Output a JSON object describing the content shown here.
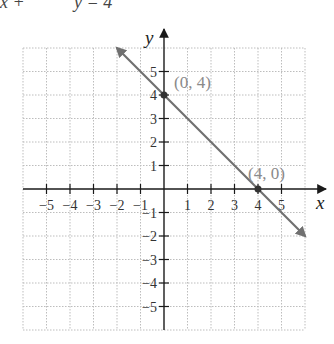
{
  "top_fragment": {
    "left": "x +",
    "right": "y = 4"
  },
  "axes": {
    "x_label": "x",
    "y_label": "y"
  },
  "chart_data": {
    "type": "line",
    "title": "",
    "equation": "x + y = 4",
    "xlabel": "x",
    "ylabel": "y",
    "xlim": [
      -6,
      6
    ],
    "ylim": [
      -6,
      6
    ],
    "grid": true,
    "x_ticks": [
      -5,
      -4,
      -3,
      -2,
      -1,
      1,
      2,
      3,
      4,
      5
    ],
    "y_ticks": [
      -5,
      -4,
      -3,
      -2,
      -1,
      1,
      2,
      3,
      4,
      5
    ],
    "x_tick_labels": [
      "−5",
      "−4",
      "−3",
      "−2",
      "−1",
      "1",
      "2",
      "3",
      "4",
      "5"
    ],
    "y_tick_labels": [
      "−5",
      "−4",
      "−3",
      "−2",
      "−1",
      "1",
      "2",
      "3",
      "4",
      "5"
    ],
    "series": [
      {
        "name": "x + y = 4",
        "x": [
          -2,
          6
        ],
        "y": [
          6,
          -2
        ],
        "color": "#707070",
        "arrows": "both"
      }
    ],
    "points": [
      {
        "x": 0,
        "y": 4,
        "label": "(0, 4)"
      },
      {
        "x": 4,
        "y": 0,
        "label": "(4, 0)"
      }
    ]
  },
  "colors": {
    "grid": "#bdbdbd",
    "axis": "#1a1a1a",
    "line": "#707070",
    "point": "#333333",
    "label": "#8a8a8a"
  }
}
